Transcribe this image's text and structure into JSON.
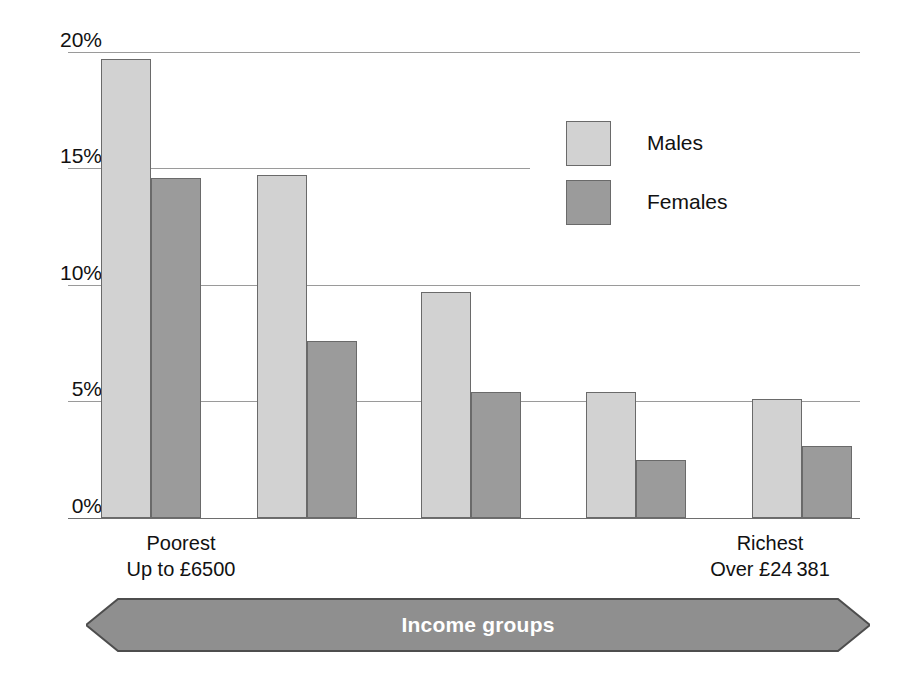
{
  "chart_data": {
    "type": "bar",
    "title": "",
    "subtitle": "",
    "xlabel": "Income groups",
    "ylabel": "",
    "ylim": [
      0,
      20
    ],
    "ytick_labels": [
      "0%",
      "5%",
      "10%",
      "15%",
      "20%"
    ],
    "ytick_values": [
      0,
      5,
      10,
      15,
      20
    ],
    "grid": true,
    "legend_position": "upper right inside",
    "categories": [
      "1",
      "2",
      "3",
      "4",
      "5"
    ],
    "category_captions": [
      {
        "line1": "Poorest",
        "line2": "Up to £6500"
      },
      {
        "line1": "",
        "line2": ""
      },
      {
        "line1": "",
        "line2": ""
      },
      {
        "line1": "",
        "line2": ""
      },
      {
        "line1": "Richest",
        "line2": "Over £24 381"
      }
    ],
    "series": [
      {
        "name": "Males",
        "color": "#d2d2d2",
        "values": [
          19.7,
          14.7,
          9.7,
          5.4,
          5.1
        ]
      },
      {
        "name": "Females",
        "color": "#9b9b9b",
        "values": [
          14.6,
          7.6,
          5.4,
          2.5,
          3.1
        ]
      }
    ]
  },
  "legend": {
    "items": [
      {
        "label": "Males",
        "color": "#d2d2d2"
      },
      {
        "label": "Females",
        "color": "#9b9b9b"
      }
    ]
  },
  "axis": {
    "x_banner_label": "Income groups",
    "left_caption_line1": "Poorest",
    "left_caption_line2": "Up to £6500",
    "right_caption_line1": "Richest",
    "right_caption_line2": "Over £24 381"
  },
  "colors": {
    "male_fill": "#d2d2d2",
    "female_fill": "#9b9b9b",
    "bar_stroke": "#6a6a6a",
    "gridline": "#9a9a9a",
    "banner_fill": "#8f8f8f",
    "banner_stroke": "#4d4d4d",
    "banner_text": "#ffffff"
  }
}
